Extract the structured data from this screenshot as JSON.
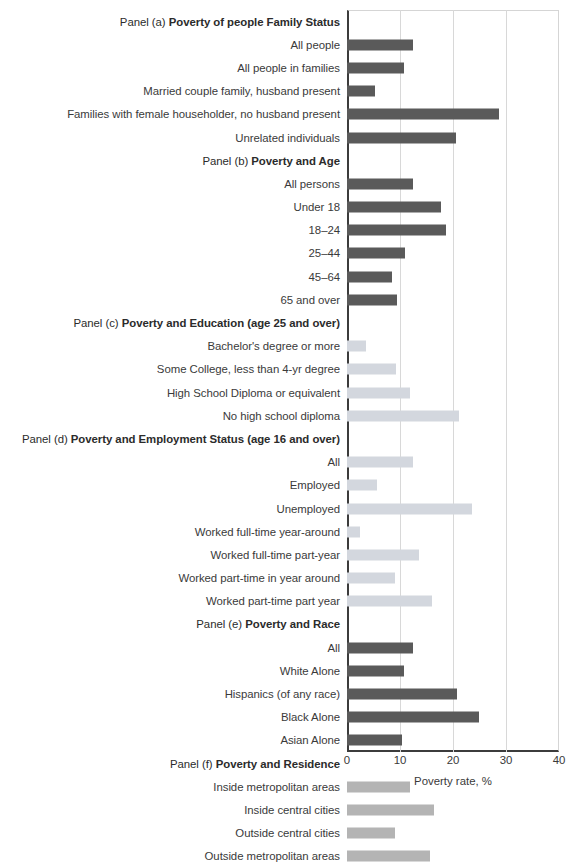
{
  "chart_data": {
    "type": "bar",
    "orientation": "horizontal",
    "title": "",
    "xlabel": "Poverty rate, %",
    "ylabel": "",
    "xlim": [
      0,
      40
    ],
    "xticks": [
      0,
      10,
      20,
      30,
      40
    ],
    "grid": "vertical",
    "legend": "none",
    "colors": {
      "dark_gray": "#5a5a5a",
      "light_gray": "#d3d7de",
      "medium_gray": "#b4b4b4",
      "axis": "#3c3c3c",
      "gridline": "#d8d8d8",
      "text": "#3a3a3a"
    },
    "panels": [
      {
        "prefix": "Panel (a)",
        "title": "Poverty of people Family Status",
        "color": "#5a5a5a",
        "categories": [
          "All people",
          "All people in families",
          "Married couple family, husband present",
          "Families with female householder, no husband present",
          "Unrelated individuals"
        ],
        "values": [
          12.5,
          10.7,
          5.2,
          28.7,
          20.5
        ]
      },
      {
        "prefix": "Panel (b)",
        "title": "Poverty and Age",
        "color": "#5a5a5a",
        "categories": [
          "All persons",
          "Under 18",
          "18–24",
          "25–44",
          "45–64",
          "65 and over"
        ],
        "values": [
          12.5,
          17.8,
          18.6,
          10.9,
          8.5,
          9.4
        ]
      },
      {
        "prefix": "Panel (c)",
        "title": "Poverty and Education (age 25 and over)",
        "color": "#d3d7de",
        "categories": [
          "Bachelor's degree or more",
          "Some College, less than 4-yr degree",
          "High School Diploma or equivalent",
          "No high school diploma"
        ],
        "values": [
          3.6,
          9.2,
          11.8,
          21.1
        ]
      },
      {
        "prefix": "Panel (d)",
        "title": "Poverty and Employment Status (age 16 and over)",
        "color": "#d3d7de",
        "categories": [
          "All",
          "Employed",
          "Unemployed",
          "Worked full-time year-around",
          "Worked full-time part-year",
          "Worked part-time in year around",
          "Worked part-time part year"
        ],
        "values": [
          12.5,
          5.6,
          23.6,
          2.5,
          13.5,
          9.1,
          16.1
        ]
      },
      {
        "prefix": "Panel (e)",
        "title": "Poverty and Race",
        "color": "#5a5a5a",
        "categories": [
          "All",
          "White Alone",
          "Hispanics (of any race)",
          "Black Alone",
          "Asian Alone"
        ],
        "values": [
          12.5,
          10.7,
          20.8,
          24.9,
          10.4
        ]
      },
      {
        "prefix": "Panel (f)",
        "title": "Poverty and Residence",
        "color": "#b4b4b4",
        "categories": [
          "Inside metropolitan areas",
          "Inside central cities",
          "Outside central cities",
          "Outside metropolitan areas"
        ],
        "values": [
          11.9,
          16.5,
          9.1,
          15.7
        ]
      }
    ]
  }
}
